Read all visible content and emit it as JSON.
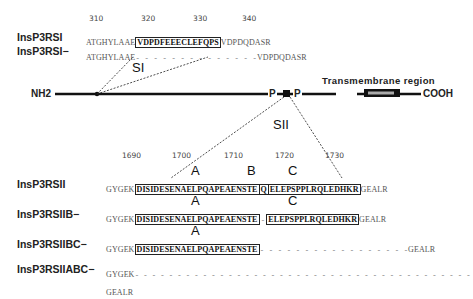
{
  "ticks_top": [
    "310",
    "320",
    "330",
    "340"
  ],
  "si": {
    "label": "SI",
    "rows": [
      {
        "name": "InsP3RSI",
        "pre": "ATGHYLAAE",
        "box": "VDPDFEEECLEFQPS",
        "post": "VDPDQDASR"
      },
      {
        "name": "InsP3RSI−",
        "pre": "ATGHYLAAE",
        "dashes": "- - - - - - - - - - - - - -",
        "post": "VDPDQDASR"
      }
    ]
  },
  "protein": {
    "nterm": "NH2",
    "cterm": "COOH",
    "p1": "P",
    "p2": "P",
    "tm_label": "Transmembrane region"
  },
  "sii": {
    "label": "SII",
    "ticks": [
      "1690",
      "1700",
      "1710",
      "1720",
      "1730"
    ],
    "segments": {
      "a": "A",
      "b": "B",
      "c": "C"
    },
    "rows": [
      {
        "name": "InsP3RSII",
        "pre": "GYGEK",
        "a": "DISIDESENAELPQAPEAENSTE",
        "b": "Q",
        "c": "ELEPSPPLRQLEDHKR",
        "post": "GEALR"
      },
      {
        "name": "InsP3RSIIB−",
        "pre": "GYGEK",
        "a": "DISIDESENAELPQAPEAENSTE",
        "gap": "-",
        "c": "ELEPSPPLRQLEDHKR",
        "post": "GEALR"
      },
      {
        "name": "InsP3RSIIBC−",
        "pre": "GYGEK",
        "a": "DISIDESENAELPQAPEAENSTE",
        "dashes": "- - - - - - - - - - - - - - - - -",
        "post": "GEALR"
      },
      {
        "name": "InsP3RSIIABC−",
        "pre": "GYGEK",
        "dashes": "- - - - - - - - - - - - - - - - - - - - - - - - - - - - - - - - - - - - - - - -",
        "post": "GEALR"
      }
    ]
  }
}
